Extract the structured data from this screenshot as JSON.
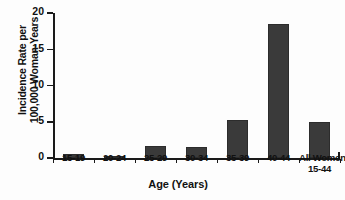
{
  "chart_data": {
    "type": "bar",
    "title": "",
    "xlabel": "Age (Years)",
    "ylabel_lines": [
      "Incidence Rate per",
      "100,000 Woman-Years"
    ],
    "ylabel": "Incidence Rate per 100,000 Woman-Years",
    "categories": [
      "15-19",
      "20-24",
      "25-29",
      "30-34",
      "35-39",
      "40-44",
      "All Women 15-44"
    ],
    "category_labels": [
      {
        "line1": "15-19",
        "line2": ""
      },
      {
        "line1": "20-24",
        "line2": ""
      },
      {
        "line1": "25-29",
        "line2": ""
      },
      {
        "line1": "30-34",
        "line2": ""
      },
      {
        "line1": "35-39",
        "line2": ""
      },
      {
        "line1": "40-44",
        "line2": ""
      },
      {
        "line1": "All Women",
        "line2": "15-44"
      }
    ],
    "values": [
      0.5,
      0.1,
      1.6,
      1.5,
      5.3,
      18.5,
      5.0
    ],
    "ylim": [
      0,
      20
    ],
    "yticks": [
      0,
      5,
      10,
      15,
      20
    ],
    "ytick_labels": [
      "0",
      "5",
      "10",
      "15",
      "20"
    ],
    "grid": false,
    "legend": false,
    "bar_color": "#3a3a3a",
    "axis_color": "#1a1a1a",
    "background_color": "#fdfdfd"
  }
}
